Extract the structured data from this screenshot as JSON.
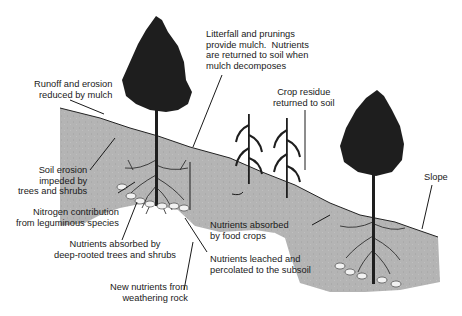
{
  "diagram": {
    "type": "agroforestry nutrient cycling illustration",
    "colors": {
      "soil": "#b4b4b4",
      "soil_dark": "#a2a2a2",
      "tree": "#1e1e1e",
      "rock": "#f2f2f2",
      "text": "#1a1a1a"
    },
    "labels": {
      "runoff": "Runoff and erosion\nreduced by mulch",
      "litterfall": "Litterfall and prunings\nprovide mulch.  Nutrients\nare returned to soil when\nmulch decomposes",
      "crop_residue": "Crop residue\nreturned to soil",
      "soil_erosion": "Soil erosion\nimpeded by\ntrees and shrubs",
      "nitrogen": "Nitrogen contribution\nfrom leguminous species",
      "absorbed_deep": "Nutrients absorbed by\ndeep-rooted trees and shrubs",
      "new_nutrients": "New nutrients from\nweathering rock",
      "absorbed_crops": "Nutrients absorbed\nby food crops",
      "leached": "Nutrients leached and\npercolated to the subsoil",
      "slope": "Slope"
    }
  }
}
